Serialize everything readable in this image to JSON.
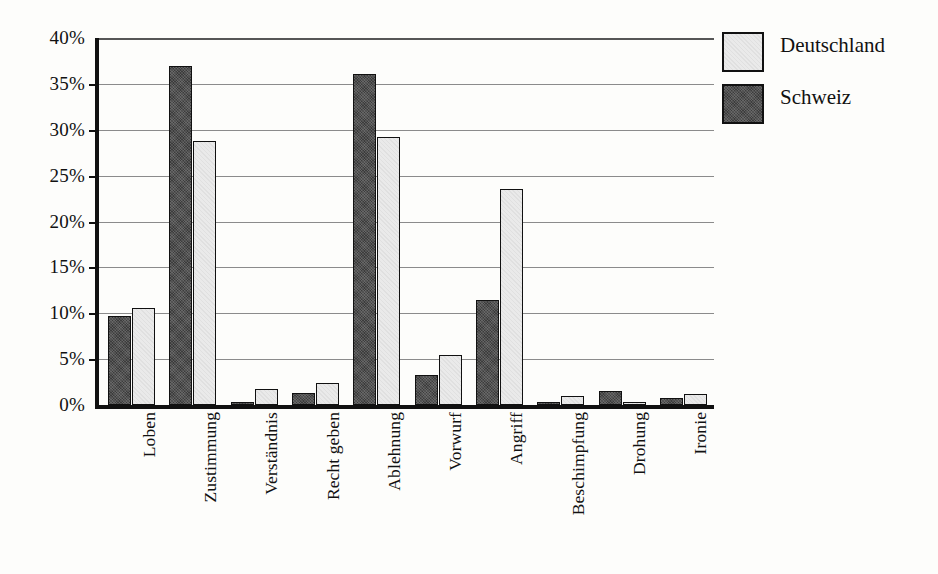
{
  "chart_data": {
    "type": "bar",
    "title": "",
    "subtitle": "",
    "xlabel": "",
    "ylabel": "",
    "ylim": [
      0,
      40
    ],
    "ytick_step": 5,
    "ytick_labels": [
      "40%",
      "35%",
      "30%",
      "25%",
      "20%",
      "15%",
      "10%",
      "5%",
      "0%"
    ],
    "ytick_values": [
      40,
      35,
      30,
      25,
      20,
      15,
      10,
      5,
      0
    ],
    "grid": "horizontal",
    "legend_position": "top-right",
    "value_unit": "%",
    "categories": [
      "Loben",
      "Zustimmung",
      "Verständnis",
      "Recht geben",
      "Ablehnung",
      "Vorwurf",
      "Angriff",
      "Beschimpfung",
      "Drohung",
      "Ironie"
    ],
    "series": [
      {
        "name": "Schweiz",
        "color": "#3c3c3c",
        "values": [
          9.7,
          37.0,
          0.2,
          1.3,
          36.1,
          3.3,
          11.4,
          0.1,
          1.5,
          0.8
        ]
      },
      {
        "name": "Deutschland",
        "color": "#eaeaea",
        "values": [
          10.6,
          28.8,
          1.8,
          2.4,
          29.2,
          5.4,
          23.5,
          1.0,
          0.3,
          1.2
        ]
      }
    ]
  },
  "legend": {
    "entries": [
      {
        "label": "Deutschland",
        "swatch": "deutschland"
      },
      {
        "label": "Schweiz",
        "swatch": "schweiz"
      }
    ]
  }
}
